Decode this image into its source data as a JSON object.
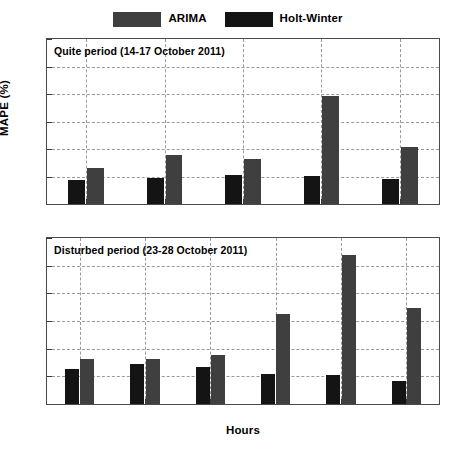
{
  "legend": {
    "items": [
      {
        "label": "ARIMA",
        "color": "#3f3f3f"
      },
      {
        "label": "Holt-Winter",
        "color": "#141414"
      }
    ]
  },
  "axes": {
    "ylabel": "MAPE (%)",
    "xlabel": "Hours",
    "yticks": [
      "0",
      "5",
      "10",
      "15",
      "20",
      "25",
      "30"
    ]
  },
  "chart_data": [
    {
      "type": "bar",
      "title": "Quite period (14-17 October 2011)",
      "xlabel": "",
      "ylabel": "MAPE (%)",
      "ylim": [
        0,
        30
      ],
      "ytick_step": 5,
      "grid": true,
      "legend_position": "top-center",
      "categories": [
        "24",
        "48",
        "72",
        "96",
        "122"
      ],
      "series": [
        {
          "name": "Holt-Winter",
          "color": "#141414",
          "values": [
            4.3,
            4.8,
            5.2,
            5.1,
            4.5
          ]
        },
        {
          "name": "ARIMA",
          "color": "#3f3f3f",
          "values": [
            6.6,
            8.9,
            8.1,
            19.7,
            10.4
          ]
        }
      ]
    },
    {
      "type": "bar",
      "title": "Disturbed period (23-28 October 2011)",
      "xlabel": "Hours",
      "ylabel": "MAPE (%)",
      "ylim": [
        0,
        30
      ],
      "ytick_step": 5,
      "grid": true,
      "legend_position": "top-center",
      "categories": [
        "24",
        "48",
        "72",
        "96",
        "122",
        "144"
      ],
      "series": [
        {
          "name": "Holt-Winter",
          "color": "#141414",
          "values": [
            6.4,
            7.2,
            6.7,
            5.5,
            5.2,
            4.2
          ]
        },
        {
          "name": "ARIMA",
          "color": "#3f3f3f",
          "values": [
            8.1,
            8.2,
            8.8,
            16.3,
            26.9,
            17.3
          ]
        }
      ]
    }
  ]
}
